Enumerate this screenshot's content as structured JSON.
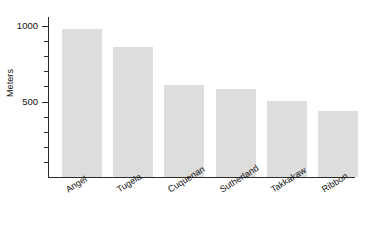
{
  "chart_data": {
    "type": "bar",
    "title": "",
    "subtitle": "",
    "xlabel": "",
    "ylabel": "Meters",
    "categories": [
      "Angel",
      "Tugela",
      "Cuquenan",
      "Sutherland",
      "Takkakaw",
      "Ribbon"
    ],
    "values": [
      979,
      860,
      610,
      580,
      503,
      440
    ],
    "ylim": [
      0,
      1060
    ],
    "y_major_ticks": [
      500,
      1000
    ],
    "y_major_tick_labels": [
      "500",
      "1000"
    ],
    "y_minor_ticks": [
      100,
      200,
      300,
      400,
      600,
      700,
      800,
      900
    ],
    "grid": false,
    "legend": null,
    "legend_position": "none",
    "bar_color": "#dddddd",
    "axis_color": "#2b2b2b",
    "text_color": "#111111",
    "background_color": "#ffffff",
    "category_label_rotation_deg": -32
  }
}
